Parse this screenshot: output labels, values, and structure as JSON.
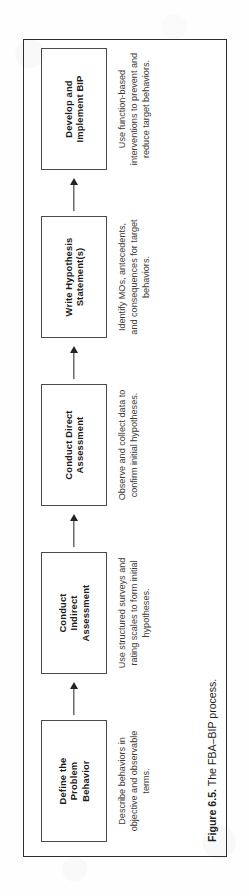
{
  "figure": {
    "caption_label": "Figure 6.5.",
    "caption_text": " The FBA–BIP process.",
    "orientation": "rotated-90-ccw",
    "border_color": "#2f2f2f"
  },
  "flow": {
    "steps": [
      {
        "title": "Define the\nProblem\nBehavior",
        "description": "Describe behaviors in objective and observable terms."
      },
      {
        "title": "Conduct\nIndirect\nAssessment",
        "description": "Use structured surveys and rating scales to form initial hypotheses."
      },
      {
        "title": "Conduct Direct\nAssessment",
        "description": "Observe and collect data to confirm initial hypotheses."
      },
      {
        "title": "Write Hypothesis\nStatement(s)",
        "description": "Identify MOs, antecedents, and consequences for target behaviors."
      },
      {
        "title": "Develop and\nImplement BIP",
        "description": "Use function-based interventions to prevent and reduce target behaviors."
      }
    ]
  }
}
